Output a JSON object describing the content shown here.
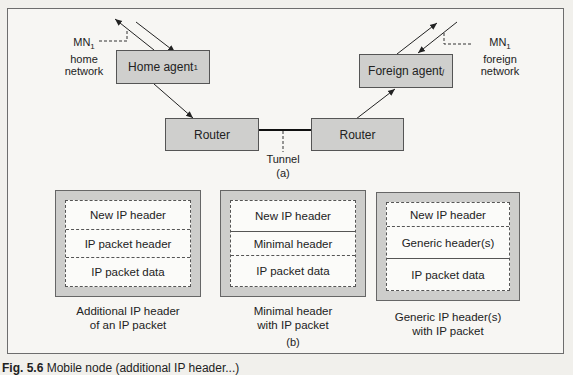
{
  "diagram": {
    "part_a": {
      "label": "(a)",
      "home_agent": {
        "name": "Home agent",
        "subscript": "1"
      },
      "foreign_agent": {
        "name": "Foreign agent",
        "subscript": "j"
      },
      "router_left": "Router",
      "router_right": "Router",
      "tunnel_label": "Tunnel",
      "mn_home": {
        "name": "MN",
        "subscript": "1",
        "line2": "home",
        "line3": "network"
      },
      "mn_foreign": {
        "name": "MN",
        "subscript": "1",
        "line2": "foreign",
        "line3": "network"
      }
    },
    "part_b": {
      "label": "(b)",
      "packets": [
        {
          "rows": [
            "New IP header",
            "IP packet header",
            "IP packet data"
          ],
          "caption_line1": "Additional IP header",
          "caption_line2": "of an IP packet"
        },
        {
          "rows": [
            "New IP header",
            "Minimal header",
            "IP packet data"
          ],
          "caption_line1": "Minimal header",
          "caption_line2": "with IP packet"
        },
        {
          "rows": [
            "New IP header",
            "Generic header(s)",
            "IP packet data"
          ],
          "caption_line1": "Generic IP header(s)",
          "caption_line2": "with IP packet"
        }
      ]
    },
    "figure_caption": {
      "number": "Fig. 5.6",
      "text": "Mobile node (additional IP header...)"
    }
  },
  "colors": {
    "box_fill": "#cfcfcd",
    "inner_fill": "#fbfbf9",
    "stroke": "#555555",
    "background": "#f7f6f3"
  }
}
